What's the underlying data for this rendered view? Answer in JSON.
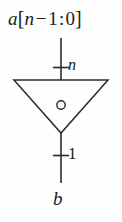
{
  "diagram": {
    "colors": {
      "stroke": "#2b2b2b",
      "background": "#fefefe",
      "text": "#1a1a1a"
    },
    "input": {
      "signal_name": "a",
      "bracket_open": "[",
      "msb_expr_var": "n",
      "minus": "−",
      "msb_offset": "1",
      "colon": ":",
      "lsb": "0",
      "bracket_close": "]",
      "full_label": "a[n − 1 : 0]",
      "bus_width_label": "n"
    },
    "gate": {
      "shape": "inverted-triangle",
      "bubble": "inversion-bubble-circle",
      "bubble_position": "inside-center"
    },
    "output": {
      "signal_name": "b",
      "bus_width_label": "1"
    }
  }
}
